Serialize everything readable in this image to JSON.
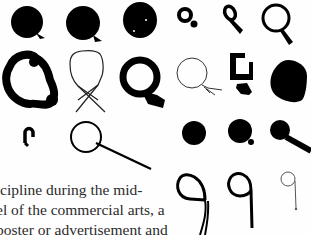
{
  "page": {
    "type": "book-page-scan",
    "background": "#ffffff",
    "ink_color": "#000000",
    "text_color": "#2b2b2b"
  },
  "figure": {
    "rows": [
      {
        "row": 1,
        "glyphs": [
          "filled-blob-small-tail",
          "filled-blob-small-tail-2",
          "filled-blob-speckled",
          "small-bold-ring-tail",
          "teardrop-ring-tail",
          "bold-ring-short-tail"
        ]
      },
      {
        "row": 2,
        "glyphs": [
          "rough-bubbly-ring",
          "thin-crossed-loop",
          "thick-ring-flag-tail",
          "thin-balloon-string",
          "square-broken-ring",
          "filled-teardrop"
        ]
      },
      {
        "row": 3,
        "glyphs": [
          "small-arch",
          "thin-ring-long-tail",
          "filled-dot",
          "filled-dot-small-tail",
          "filled-dot-stick-tail"
        ]
      },
      {
        "row": 4,
        "glyphs": [
          "nine-double-stroke",
          "nine-bold",
          "nine-thin"
        ]
      }
    ]
  },
  "body_text": {
    "lines": [
      "cipline during the mid-",
      "el of the commercial arts, a",
      "poster or advertisement and"
    ]
  }
}
